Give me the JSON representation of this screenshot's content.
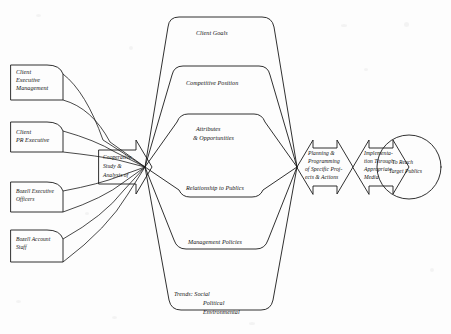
{
  "diagram": {
    "type": "process-flow",
    "background_color": "#fdfdfd",
    "stroke_color": "#1a1a1a",
    "inputs": [
      {
        "id": "client-executive-management",
        "lines": [
          "Client",
          "Executive",
          "Management"
        ]
      },
      {
        "id": "client-pr-executive",
        "lines": [
          "Client",
          "PR Executive"
        ]
      },
      {
        "id": "bozell-executive-officers",
        "lines": [
          "Bozell Executive",
          "Officers"
        ]
      },
      {
        "id": "bozell-account-staff",
        "lines": [
          "Bozell Account",
          "Staff"
        ]
      }
    ],
    "hub": {
      "id": "cooperative-study-analysis",
      "lines": [
        "Cooperative",
        "Study &",
        "Analysis of"
      ]
    },
    "study_topics": [
      {
        "id": "client-goals",
        "lines": [
          "Client Goals"
        ]
      },
      {
        "id": "competitive-position",
        "lines": [
          "Competitive Position"
        ]
      },
      {
        "id": "attributes-opportunities",
        "lines": [
          "Attributes",
          "& Opportunities"
        ]
      },
      {
        "id": "relationship-to-publics",
        "lines": [
          "Relationship to Publics"
        ]
      },
      {
        "id": "management-policies",
        "lines": [
          "Management Policies"
        ]
      },
      {
        "id": "trends",
        "lines": [
          "Trends: Social",
          "Political",
          "Environmental"
        ]
      }
    ],
    "stages": [
      {
        "id": "planning-programming",
        "lines": [
          "Planning &",
          "Programming",
          "of Specific Proj-",
          "ects & Actions"
        ]
      },
      {
        "id": "implementation",
        "lines": [
          "Implementa-",
          "tion Through",
          "Appropriate",
          "Media"
        ]
      }
    ],
    "outcome": {
      "id": "to-reach-target-publics",
      "lines": [
        "To Reach",
        "Target Publics"
      ]
    }
  }
}
